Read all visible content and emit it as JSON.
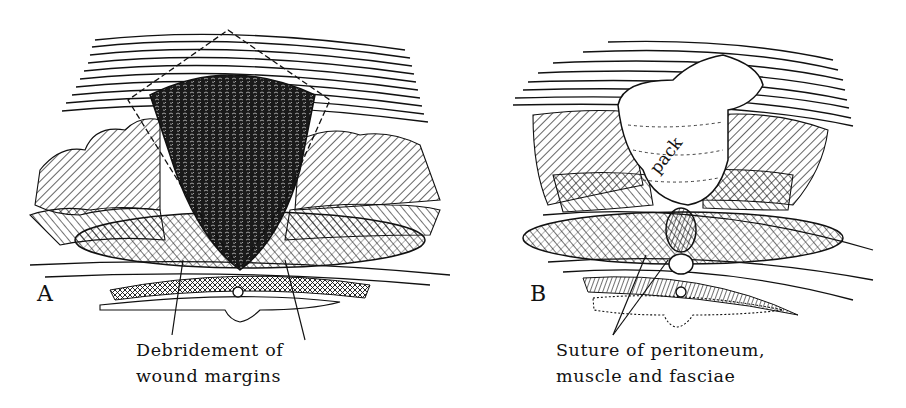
{
  "figure": {
    "panels": [
      {
        "id": "A",
        "letter": "A",
        "caption_lines": [
          "Debridement of",
          "wound margins"
        ],
        "depicts": "cross-section of abdominal wall with triangular contaminated wound; dashed excision lines outline debridement"
      },
      {
        "id": "B",
        "letter": "B",
        "caption_lines": [
          "Suture of peritoneum,",
          "muscle and fasciae"
        ],
        "depicts": "cross-section of abdominal wall with wound packed with gauze and deep layers sutured",
        "pack_label": "pack"
      }
    ],
    "colors": {
      "ink": "#111111",
      "paper": "#ffffff"
    }
  }
}
